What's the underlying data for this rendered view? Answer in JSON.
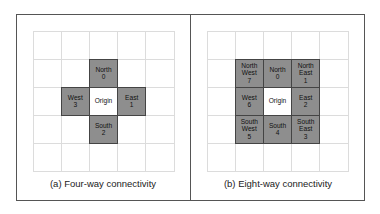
{
  "figures": [
    {
      "id": "four-way",
      "caption": "(a) Four-way connectivity",
      "cells": [
        {
          "row": 1,
          "col": 2,
          "type": "neighbor",
          "label": "North\n0"
        },
        {
          "row": 2,
          "col": 1,
          "type": "neighbor",
          "label": "West\n3"
        },
        {
          "row": 2,
          "col": 2,
          "type": "origin",
          "label": "Origin"
        },
        {
          "row": 2,
          "col": 3,
          "type": "neighbor",
          "label": "East\n1"
        },
        {
          "row": 3,
          "col": 2,
          "type": "neighbor",
          "label": "South\n2"
        }
      ]
    },
    {
      "id": "eight-way",
      "caption": "(b) Eight-way connectivity",
      "cells": [
        {
          "row": 1,
          "col": 1,
          "type": "neighbor",
          "label": "North\nWest\n7"
        },
        {
          "row": 1,
          "col": 2,
          "type": "neighbor",
          "label": "North\n0"
        },
        {
          "row": 1,
          "col": 3,
          "type": "neighbor",
          "label": "North\nEast\n1"
        },
        {
          "row": 2,
          "col": 1,
          "type": "neighbor",
          "label": "West\n6"
        },
        {
          "row": 2,
          "col": 2,
          "type": "origin",
          "label": "Origin"
        },
        {
          "row": 2,
          "col": 3,
          "type": "neighbor",
          "label": "East\n2"
        },
        {
          "row": 3,
          "col": 1,
          "type": "neighbor",
          "label": "South\nWest\n5"
        },
        {
          "row": 3,
          "col": 2,
          "type": "neighbor",
          "label": "South\n4"
        },
        {
          "row": 3,
          "col": 3,
          "type": "neighbor",
          "label": "South\nEast\n3"
        }
      ]
    }
  ],
  "grid_size": 5,
  "colors": {
    "neighbor_fill": "#8e8e8e",
    "origin_fill": "#ffffff",
    "grid_line": "#dcdcdc"
  }
}
